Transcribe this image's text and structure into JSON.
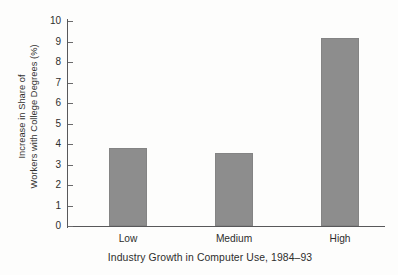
{
  "figure": {
    "background_color": "#fdfdfc",
    "axis_color": "#58585a",
    "bar_color": "#8d8d8d",
    "text_color": "#2e2e2d"
  },
  "chart_data": {
    "type": "bar",
    "title": "",
    "categories": [
      "Low",
      "Medium",
      "High"
    ],
    "values": [
      3.8,
      3.55,
      9.15
    ],
    "xlabel": "Industry Growth in Computer Use, 1984–93",
    "ylabel_line1": "Increase in Share of",
    "ylabel_line2": "Workers with College Degrees (%)",
    "ylim": [
      0,
      10
    ],
    "yticks": [
      0,
      1,
      2,
      3,
      4,
      5,
      6,
      7,
      8,
      9,
      10
    ],
    "ytick_labels": [
      "0",
      "1",
      "2",
      "3",
      "4",
      "5",
      "6",
      "7",
      "8",
      "9",
      "10"
    ],
    "grid": false,
    "legend": null,
    "legend_position": "none",
    "bar_color": "#8d8d8d",
    "annotations": []
  }
}
